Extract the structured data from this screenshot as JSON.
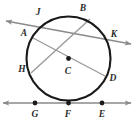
{
  "figure": {
    "type": "geometry-diagram",
    "width": 134,
    "height": 122,
    "background_color": "#ffffff",
    "stroke_colors": {
      "circle": "#1a1a1a",
      "secant_line": "#8a8a8a",
      "chord": "#9a9a9a",
      "tangent_line": "#8a8a8a",
      "dot": "#1a1a1a",
      "label": "#2b2b2b"
    },
    "circle": {
      "name": "circle-C",
      "center_label": "C",
      "cx": 68.5,
      "cy": 58.5,
      "r": 42,
      "stroke_width": 2.1
    },
    "points": [
      {
        "id": "J",
        "label": "J",
        "x": 50,
        "y": 18.5,
        "label_x": 38,
        "label_y": 13,
        "dot": false,
        "on": "circle"
      },
      {
        "id": "B",
        "label": "B",
        "x": 90,
        "y": 19,
        "label_x": 83,
        "label_y": 9,
        "dot": false,
        "on": "circle"
      },
      {
        "id": "A",
        "label": "A",
        "x": 33,
        "y": 38,
        "label_x": 24,
        "label_y": 34,
        "dot": false,
        "on": "circle"
      },
      {
        "id": "K",
        "label": "K",
        "x": 107,
        "y": 40,
        "label_x": 114,
        "label_y": 35,
        "dot": false,
        "on": "circle"
      },
      {
        "id": "H",
        "label": "H",
        "x": 31,
        "y": 73,
        "label_x": 22,
        "label_y": 70,
        "dot": false,
        "on": "circle"
      },
      {
        "id": "C",
        "label": "C",
        "x": 68.5,
        "y": 58.5,
        "label_x": 68,
        "label_y": 72,
        "dot": true,
        "on": "center"
      },
      {
        "id": "D",
        "label": "D",
        "x": 105,
        "y": 76,
        "label_x": 113,
        "label_y": 79,
        "dot": false,
        "on": "circle"
      },
      {
        "id": "G",
        "label": "G",
        "x": 35,
        "y": 103,
        "label_x": 35,
        "label_y": 115,
        "dot": true,
        "on": "tangent-line"
      },
      {
        "id": "F",
        "label": "F",
        "x": 68.5,
        "y": 103,
        "label_x": 68,
        "label_y": 115,
        "dot": true,
        "on": "tangent-point"
      },
      {
        "id": "E",
        "label": "E",
        "x": 102,
        "y": 103,
        "label_x": 102,
        "label_y": 115,
        "dot": true,
        "on": "tangent-line"
      }
    ],
    "lines": [
      {
        "id": "secant-JK",
        "name": "secant-line-jk",
        "through": [
          "J",
          "K"
        ],
        "x1": 6,
        "y1": 21,
        "x2": 131,
        "y2": 44,
        "arrow_start": true,
        "arrow_end": true,
        "stroke": "#8a8a8a",
        "stroke_width": 1.5
      },
      {
        "id": "chord-AD",
        "name": "chord-ad",
        "through": [
          "A",
          "D"
        ],
        "x1": 33,
        "y1": 38,
        "x2": 105,
        "y2": 76,
        "arrow_start": false,
        "arrow_end": false,
        "stroke": "#9a9a9a",
        "stroke_width": 1.4
      },
      {
        "id": "chord-HB",
        "name": "chord-hb",
        "through": [
          "H",
          "B"
        ],
        "x1": 31,
        "y1": 73,
        "x2": 90,
        "y2": 19,
        "arrow_start": false,
        "arrow_end": false,
        "stroke": "#9a9a9a",
        "stroke_width": 1.4
      },
      {
        "id": "tangent-GFE",
        "name": "tangent-line-gfe",
        "through": [
          "G",
          "F",
          "E"
        ],
        "x1": 3,
        "y1": 103,
        "x2": 131,
        "y2": 103,
        "arrow_start": true,
        "arrow_end": true,
        "stroke": "#8a8a8a",
        "stroke_width": 1.6
      }
    ]
  }
}
